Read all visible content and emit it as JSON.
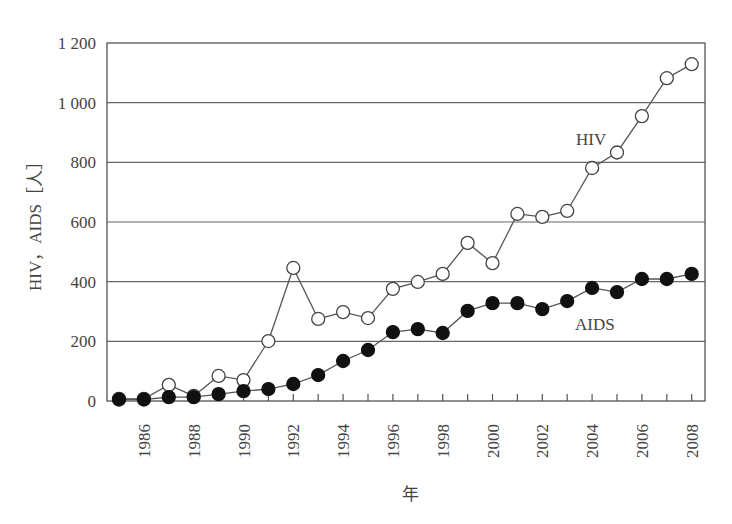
{
  "chart_data": {
    "type": "line",
    "title": "",
    "xlabel": "年",
    "ylabel": "HIV，AIDS［人］",
    "ylim": [
      0,
      1200
    ],
    "yticks": [
      0,
      200,
      400,
      600,
      800,
      1000,
      1200
    ],
    "ytick_labels": [
      "0",
      "200",
      "400",
      "600",
      "800",
      "1 000",
      "1 200"
    ],
    "x": [
      1985,
      1986,
      1987,
      1988,
      1989,
      1990,
      1991,
      1992,
      1993,
      1994,
      1995,
      1996,
      1997,
      1998,
      1999,
      2000,
      2001,
      2002,
      2003,
      2004,
      2005,
      2006,
      2007,
      2008
    ],
    "xtick_labels": [
      "1986",
      "1988",
      "1990",
      "1992",
      "1994",
      "1996",
      "1998",
      "2000",
      "2002",
      "2004",
      "2006",
      "2008"
    ],
    "grid": "horizontal",
    "legend": "inline labels",
    "series": [
      {
        "name": "HIV",
        "marker": "open-circle",
        "values": [
          7,
          7,
          54,
          17,
          84,
          70,
          201,
          446,
          275,
          298,
          278,
          376,
          399,
          426,
          530,
          462,
          627,
          617,
          637,
          781,
          833,
          955,
          1082,
          1129
        ]
      },
      {
        "name": "AIDS",
        "marker": "filled-circle",
        "values": [
          5,
          5,
          13,
          13,
          23,
          33,
          40,
          57,
          87,
          134,
          171,
          231,
          241,
          228,
          302,
          328,
          328,
          308,
          335,
          379,
          365,
          409,
          409,
          426
        ]
      }
    ]
  },
  "labels": {
    "hiv": "HIV",
    "aids": "AIDS",
    "xlabel": "年",
    "ylabel": "HIV，AIDS［人］"
  }
}
